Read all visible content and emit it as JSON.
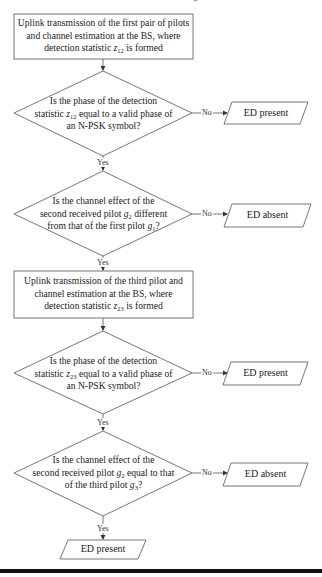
{
  "flowchart": {
    "steps": [
      {
        "id": "step1",
        "type": "process",
        "lines": [
          "Uplink transmission of the first pair of pilots",
          "and channel estimation at the BS, where",
          "detection statistic "
        ],
        "var": "z",
        "sub": "12",
        "suffix": " is formed"
      },
      {
        "id": "decision1",
        "type": "decision",
        "lines": [
          "Is the phase of the detection",
          "statistic ",
          " equal to a valid phase of",
          "an N-PSK symbol?"
        ],
        "var": "z",
        "sub": "12",
        "no_label": "No",
        "yes_label": "Yes",
        "no_outcome": "ED present"
      },
      {
        "id": "decision2",
        "type": "decision",
        "lines": [
          "Is the channel effect of the",
          "second received pilot ",
          " different",
          "from that of the first pilot ",
          "?"
        ],
        "var1": "g",
        "sub1": "2",
        "var2": "g",
        "sub2": "1",
        "no_label": "No",
        "yes_label": "Yes",
        "no_outcome": "ED absent"
      },
      {
        "id": "step2",
        "type": "process",
        "lines": [
          "Uplink transmission of the third pilot and",
          "channel estimation at the BS, where",
          "detection statistic "
        ],
        "var": "z",
        "sub": "23",
        "suffix": " is formed"
      },
      {
        "id": "decision3",
        "type": "decision",
        "lines": [
          "Is the phase of the detection",
          "statistic ",
          " equal to a valid phase of",
          "an N-PSK symbol?"
        ],
        "var": "z",
        "sub": "23",
        "no_label": "No",
        "yes_label": "Yes",
        "no_outcome": "ED present"
      },
      {
        "id": "decision4",
        "type": "decision",
        "lines": [
          "Is the channel effect of the",
          "second received pilot ",
          " equal to that",
          "of the third pilot ",
          "?"
        ],
        "var1": "g",
        "sub1": "2",
        "var2": "g",
        "sub2": "3",
        "no_label": "No",
        "yes_label": "Yes",
        "no_outcome": "ED absent"
      }
    ],
    "final_outcome": "ED present"
  },
  "colors": {
    "stroke": "#555555",
    "text": "#222222",
    "rule": "#111111",
    "background": "#ffffff"
  }
}
